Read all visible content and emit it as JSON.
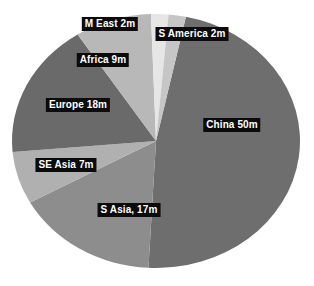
{
  "chart_data": {
    "type": "pie",
    "title": "",
    "subtitle": "",
    "xlabel": "",
    "ylabel": "",
    "unit": "m",
    "total": 105,
    "legend": "none",
    "grid": false,
    "categories": [
      "China",
      "S Asia",
      "SE Asia",
      "Europe",
      "Africa",
      "M East",
      "S America"
    ],
    "values": [
      50,
      17,
      7,
      18,
      9,
      2,
      2
    ],
    "slices": [
      {
        "name": "China",
        "value": 50,
        "label": "China 50m",
        "color": "#6e6e6e",
        "start_angle": 12,
        "end_angle": 183,
        "label_x": 232,
        "label_y": 125
      },
      {
        "name": "S Asia",
        "value": 17,
        "label": "S Asia, 17m",
        "color": "#8d8d8d",
        "start_angle": 183,
        "end_angle": 241,
        "label_x": 129,
        "label_y": 210
      },
      {
        "name": "SE Asia",
        "value": 7,
        "label": "SE Asia 7m",
        "color": "#b0b0b0",
        "start_angle": 241,
        "end_angle": 265,
        "label_x": 66,
        "label_y": 165
      },
      {
        "name": "Europe",
        "value": 18,
        "label": "Europe 18m",
        "color": "#6a6a6a",
        "start_angle": 265,
        "end_angle": 327,
        "label_x": 78,
        "label_y": 105
      },
      {
        "name": "Africa",
        "value": 9,
        "label": "Africa 9m",
        "color": "#b8b8b8",
        "start_angle": 327,
        "end_angle": 358,
        "label_x": 103,
        "label_y": 60
      },
      {
        "name": "M East",
        "value": 2,
        "label": "M East 2m",
        "color": "#e6e6e6",
        "start_angle": 358,
        "end_angle": 365,
        "label_x": 110,
        "label_y": 24
      },
      {
        "name": "S America",
        "value": 2,
        "label": "S America 2m",
        "color": "#c6c6c6",
        "start_angle": 365,
        "end_angle": 372,
        "label_x": 192,
        "label_y": 34
      }
    ],
    "geometry": {
      "center_x": 156,
      "center_y": 141,
      "radius_x": 144,
      "radius_y": 127
    },
    "background_color": "#ffffff",
    "label_text_color": "#ffffff",
    "label_background_color": "#0b0b0b"
  }
}
